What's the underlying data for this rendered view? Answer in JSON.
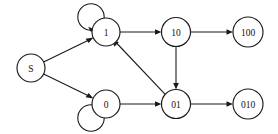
{
  "diagram": {
    "type": "state-machine-graph",
    "width": 278,
    "height": 134,
    "background_color": "#ffffff",
    "stroke_color": "#1a1a1a",
    "node_fill_color": "#ffffff",
    "label_color": "#111111",
    "nodes": [
      {
        "id": "S",
        "label": "S",
        "cx": 31,
        "cy": 68,
        "r": 14,
        "font_size": 9.5,
        "self_loop": false
      },
      {
        "id": "1",
        "label": "1",
        "cx": 106,
        "cy": 32,
        "r": 14,
        "font_size": 9.5,
        "self_loop": true
      },
      {
        "id": "10",
        "label": "10",
        "cx": 176,
        "cy": 32,
        "r": 14.5,
        "font_size": 9.5,
        "self_loop": false
      },
      {
        "id": "100",
        "label": "100",
        "cx": 248,
        "cy": 32,
        "r": 15,
        "font_size": 9.5,
        "self_loop": false
      },
      {
        "id": "0",
        "label": "0",
        "cx": 106,
        "cy": 104,
        "r": 14,
        "font_size": 9.5,
        "self_loop": true
      },
      {
        "id": "01",
        "label": "01",
        "cx": 176,
        "cy": 104,
        "r": 14.5,
        "font_size": 9.5,
        "self_loop": false
      },
      {
        "id": "010",
        "label": "010",
        "cx": 248,
        "cy": 104,
        "r": 15,
        "font_size": 9.5,
        "self_loop": false
      }
    ],
    "edges": [
      {
        "from": "S",
        "to": "1",
        "label": "",
        "kind": "straight"
      },
      {
        "from": "S",
        "to": "0",
        "label": "",
        "kind": "straight"
      },
      {
        "from": "1",
        "to": "10",
        "label": "",
        "kind": "straight"
      },
      {
        "from": "10",
        "to": "100",
        "label": "",
        "kind": "straight"
      },
      {
        "from": "10",
        "to": "01",
        "label": "",
        "kind": "straight"
      },
      {
        "from": "0",
        "to": "01",
        "label": "",
        "kind": "straight"
      },
      {
        "from": "01",
        "to": "010",
        "label": "",
        "kind": "straight"
      },
      {
        "from": "01",
        "to": "1",
        "label": "",
        "kind": "straight"
      }
    ],
    "self_loops": [
      {
        "node": "1",
        "label": "",
        "position": "upper-left"
      },
      {
        "node": "0",
        "label": "",
        "position": "lower-left"
      }
    ]
  }
}
